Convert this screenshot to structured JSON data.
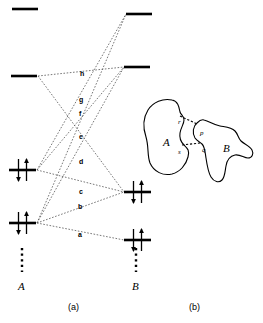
{
  "figure": {
    "panels": [
      {
        "key": "a",
        "caption": "(a)",
        "caption_x": 68,
        "caption_y": 302
      },
      {
        "key": "b",
        "caption": "(b)",
        "caption_x": 189,
        "caption_y": 302
      }
    ],
    "group_labels": [
      {
        "name": "group-label-A",
        "text": "A",
        "x": 18,
        "y": 280
      },
      {
        "name": "group-label-B",
        "text": "B",
        "x": 132,
        "y": 280
      }
    ]
  },
  "energy_diagram": {
    "levels_left": [
      {
        "id": "A4",
        "occupancy": "empty",
        "x1": 12,
        "x2": 38,
        "y": 9
      },
      {
        "id": "A3",
        "occupancy": "empty",
        "x1": 11,
        "x2": 37,
        "y": 76
      },
      {
        "id": "A2",
        "occupancy": "paired",
        "x1": 9,
        "x2": 36,
        "y": 170
      },
      {
        "id": "A1",
        "occupancy": "paired",
        "x1": 9,
        "x2": 36,
        "y": 223
      }
    ],
    "levels_right": [
      {
        "id": "B4",
        "occupancy": "empty",
        "x1": 126,
        "x2": 152,
        "y": 14
      },
      {
        "id": "B3",
        "occupancy": "empty",
        "x1": 124,
        "x2": 150,
        "y": 67
      },
      {
        "id": "B2",
        "occupancy": "paired",
        "x1": 124,
        "x2": 151,
        "y": 192
      },
      {
        "id": "B1",
        "occupancy": "paired",
        "x1": 124,
        "x2": 151,
        "y": 240
      }
    ],
    "continuation_dots": [
      {
        "name": "continuation-dots-A",
        "x": 22,
        "y1": 248,
        "y2": 272
      },
      {
        "name": "continuation-dots-B",
        "x": 136,
        "y1": 248,
        "y2": 272
      }
    ],
    "couplings": [
      {
        "label": "a",
        "lx": 78,
        "ly": 231,
        "from": [
          37,
          223
        ],
        "to": [
          124,
          240
        ]
      },
      {
        "label": "b",
        "lx": 78,
        "ly": 203,
        "from": [
          37,
          223
        ],
        "to": [
          124,
          192
        ]
      },
      {
        "label": "c",
        "lx": 79,
        "ly": 188,
        "from": [
          37,
          170
        ],
        "to": [
          124,
          192
        ]
      },
      {
        "label": "d",
        "lx": 79,
        "ly": 158,
        "from": [
          37,
          170
        ],
        "to": [
          124,
          67
        ]
      },
      {
        "label": "e",
        "lx": 79,
        "ly": 133,
        "from": [
          37,
          223
        ],
        "to": [
          124,
          67
        ]
      },
      {
        "label": "f",
        "lx": 79,
        "ly": 110,
        "from": [
          37,
          170
        ],
        "to": [
          126,
          14
        ]
      },
      {
        "label": "g",
        "lx": 79,
        "ly": 96,
        "from": [
          37,
          223
        ],
        "to": [
          126,
          14
        ]
      },
      {
        "label": "h",
        "lx": 80,
        "ly": 70,
        "from": [
          38,
          76
        ],
        "to": [
          124,
          67
        ]
      },
      {
        "label": "",
        "lx": 0,
        "ly": 0,
        "from": [
          38,
          76
        ],
        "to": [
          124,
          192
        ]
      }
    ]
  },
  "overlap_diagram": {
    "blob_labels": [
      {
        "name": "blob-label-A",
        "text": "A",
        "x": 163,
        "y": 136
      },
      {
        "name": "blob-label-B",
        "text": "B",
        "x": 223,
        "y": 142
      }
    ],
    "site_labels": [
      {
        "name": "site-label-r",
        "text": "r",
        "x": 178,
        "y": 118
      },
      {
        "name": "site-label-s",
        "text": "s",
        "x": 178,
        "y": 148
      },
      {
        "name": "site-label-p",
        "text": "p",
        "x": 200,
        "y": 129
      },
      {
        "name": "site-label-q",
        "text": "q",
        "x": 202,
        "y": 146
      }
    ],
    "overlap_links": [
      {
        "name": "overlap-link-rp",
        "from": [
          180,
          116
        ],
        "to": [
          197,
          124
        ]
      },
      {
        "name": "overlap-link-sq",
        "from": [
          182,
          145
        ],
        "to": [
          200,
          143
        ]
      }
    ]
  },
  "colors": {
    "stroke": "#000000",
    "dash": "#555555",
    "background": "#ffffff"
  }
}
